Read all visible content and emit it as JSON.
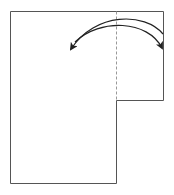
{
  "diagram": {
    "type": "fold-instruction",
    "colors": {
      "background": "#ffffff",
      "outline": "#555555",
      "fold_line": "#999999",
      "arrow": "#222222"
    },
    "sheet": {
      "x": 10,
      "y": 11,
      "width": 106,
      "height": 172
    },
    "flap": {
      "x": 116,
      "y": 11,
      "width": 47,
      "height": 89
    },
    "fold_line": {
      "x": 116,
      "y1": 11,
      "y2": 100,
      "style": "dashed"
    },
    "arrows": [
      {
        "name": "fold-left-arrow",
        "direction": "left",
        "from": [
          163,
          38
        ],
        "to": [
          70,
          48
        ]
      },
      {
        "name": "fold-right-arrow",
        "direction": "right",
        "from": [
          75,
          42
        ],
        "to": [
          162,
          48
        ]
      }
    ]
  }
}
